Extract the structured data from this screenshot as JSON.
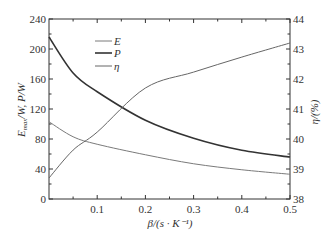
{
  "chart_data": {
    "type": "line",
    "title": "",
    "xlabel": "β/(s · K⁻¹)",
    "ylabel": "E_max/W, P/W",
    "ylabel_right": "η/(%)",
    "xlim": [
      0,
      0.5
    ],
    "ylim": [
      0,
      240
    ],
    "ylim_right": [
      38,
      44
    ],
    "x_ticks": [
      "0.1",
      "0.2",
      "0.3",
      "0.4",
      "0.5"
    ],
    "y_ticks": [
      "0",
      "40",
      "80",
      "120",
      "160",
      "200",
      "240"
    ],
    "y_ticks_right": [
      "38",
      "39",
      "40",
      "41",
      "42",
      "43",
      "44"
    ],
    "grid": false,
    "legend_position": "upper-left-center",
    "x": [
      0.0,
      0.05,
      0.1,
      0.2,
      0.3,
      0.4,
      0.5
    ],
    "series": [
      {
        "name": "E",
        "axis": "left",
        "color": "#7a7a7a",
        "width": 1,
        "values": [
          103,
          83,
          73,
          59,
          47,
          39,
          33
        ]
      },
      {
        "name": "P",
        "axis": "left",
        "color": "#333333",
        "width": 1.6,
        "values": [
          216,
          168,
          143,
          105,
          81,
          65,
          56
        ]
      },
      {
        "name": "η",
        "axis": "right",
        "color": "#666666",
        "width": 1,
        "values": [
          38.7,
          39.63,
          40.23,
          41.7,
          42.23,
          42.73,
          43.2
        ]
      }
    ]
  },
  "labels": {
    "xlabel": "β/(s · K⁻¹)",
    "ylabel_main": "E",
    "ylabel_sub": "max",
    "ylabel_rest": "/W,  P/W",
    "ylabel_right": "η/(%)"
  },
  "legend": [
    {
      "label": "E"
    },
    {
      "label": "P"
    },
    {
      "label": "η"
    }
  ]
}
